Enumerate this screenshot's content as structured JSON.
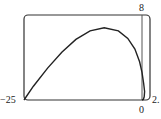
{
  "chart_data": {
    "type": "line",
    "title": "",
    "xlabel": "",
    "ylabel": "",
    "xlim": [
      -25,
      2.5
    ],
    "ylim": [
      0,
      8
    ],
    "grid": false,
    "tick_labels": {
      "x_min": "−25",
      "x_max": "2.",
      "x_zero": "0",
      "y_max": "8"
    },
    "series": [
      {
        "name": "curve",
        "x": [
          -25,
          -23,
          -20,
          -17,
          -14,
          -11,
          -8,
          -5,
          -3,
          -1.5,
          -0.5,
          0,
          0.5,
          0.8,
          0.7,
          0.4,
          0
        ],
        "y": [
          0,
          1.3,
          3.0,
          4.5,
          5.7,
          6.5,
          6.8,
          6.5,
          5.8,
          4.8,
          3.6,
          2.6,
          1.6,
          0.8,
          0.3,
          0.05,
          0
        ]
      }
    ],
    "colors": {
      "curve": "#222222",
      "frame": "#333333",
      "axis": "#555555"
    }
  }
}
